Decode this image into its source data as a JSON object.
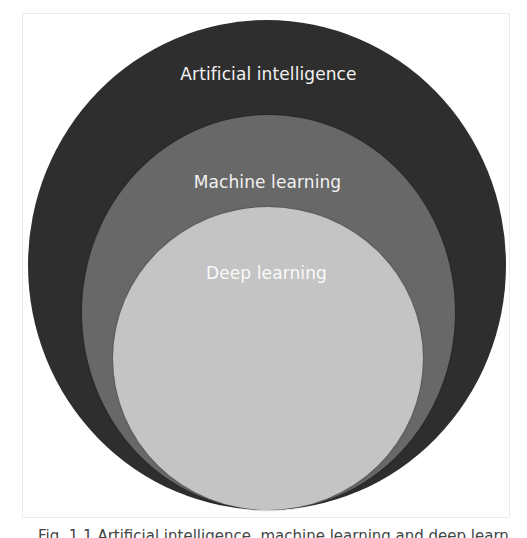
{
  "diagram": {
    "type": "nested-euler-diagram",
    "sets": [
      {
        "id": "outer",
        "label": "Artificial intelligence",
        "fill": "#2e2e2e",
        "contains": "middle"
      },
      {
        "id": "middle",
        "label": "Machine learning",
        "fill": "#686868",
        "contains": "inner"
      },
      {
        "id": "inner",
        "label": "Deep learning",
        "fill": "#c4c4c4",
        "contains": null
      }
    ],
    "label_color": "#f2f2f2",
    "frame_border": "#ececec"
  },
  "caption": {
    "text": "Fig. 1.1  Artificial intelligence, machine learning and deep learning."
  }
}
